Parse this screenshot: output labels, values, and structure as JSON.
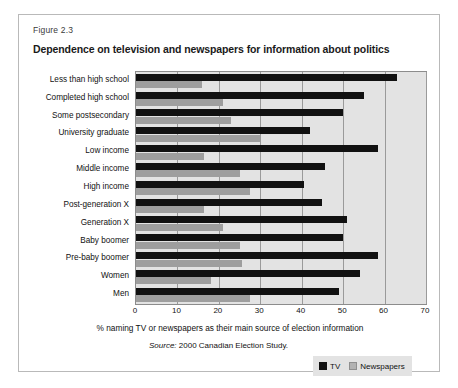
{
  "figure": {
    "number": "Figure 2.3",
    "title": "Dependence on television and newspapers for information about politics",
    "source_prefix": "Source:",
    "source_text": "2000 Canadian Election Study."
  },
  "legend": {
    "tv_label": "TV",
    "newspapers_label": "Newspapers",
    "tv_color": "#111111",
    "newspapers_color": "#9e9e9e"
  },
  "chart_data": {
    "type": "bar",
    "orientation": "horizontal",
    "title": "Dependence on television and newspapers for information about politics",
    "xlabel": "% naming TV or newspapers as their main source of election information",
    "ylabel": "",
    "xlim": [
      0,
      70
    ],
    "xticks": [
      0,
      10,
      20,
      30,
      40,
      50,
      60,
      70
    ],
    "grid": true,
    "legend_position": "bottom-right",
    "categories": [
      "Less than high school",
      "Completed high school",
      "Some postsecondary",
      "University graduate",
      "Low income",
      "Middle income",
      "High income",
      "Post-generation X",
      "Generation X",
      "Baby boomer",
      "Pre-baby boomer",
      "Women",
      "Men"
    ],
    "series": [
      {
        "name": "TV",
        "color": "#111111",
        "values": [
          63,
          55,
          50,
          42,
          58.5,
          45.5,
          40.5,
          45,
          51,
          50,
          58.5,
          54,
          49
        ]
      },
      {
        "name": "Newspapers",
        "color": "#9e9e9e",
        "values": [
          16,
          21,
          23,
          30,
          16.5,
          25,
          27.5,
          16.5,
          21,
          25,
          25.5,
          18,
          27.5
        ]
      }
    ]
  }
}
